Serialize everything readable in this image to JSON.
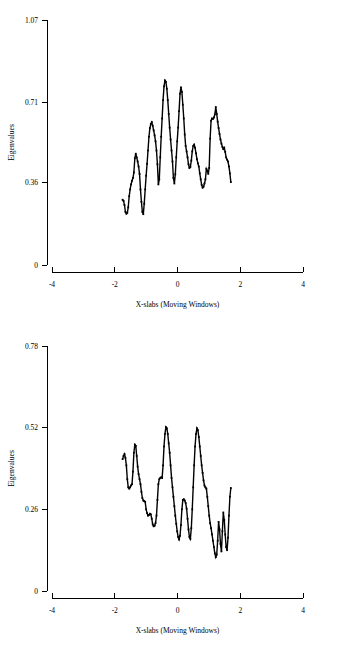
{
  "page": {
    "background_color": "#ffffff",
    "line_color": "#000000",
    "text_color": "#000000"
  },
  "charts": [
    {
      "id": "top",
      "ylabel": "Eigenvalues",
      "xlabel": "X-slabs  (Moving Windows)",
      "ytick_labels": [
        "1.07",
        "0.71",
        "0.36",
        "0"
      ],
      "xtick_labels": [
        "-4",
        "-2",
        "0",
        "2",
        "4"
      ]
    },
    {
      "id": "bottom",
      "ylabel": "Eigenvalues",
      "xlabel": "X-slabs  (Moving Windows)",
      "ytick_labels": [
        "0.78",
        "0.52",
        "0.26",
        "0"
      ],
      "xtick_labels": [
        "-4",
        "-2",
        "0",
        "2",
        "4"
      ]
    }
  ],
  "chart_data": [
    {
      "type": "line",
      "id": "eigenvalue-spectrum-top",
      "title": "",
      "xlabel": "X-slabs  (Moving Windows)",
      "ylabel": "Eigenvalues",
      "xlim": [
        -4,
        4
      ],
      "ylim": [
        0,
        1.07
      ],
      "xticks": [
        -4,
        -2,
        0,
        2,
        4
      ],
      "yticks": [
        0,
        0.36,
        0.71,
        1.07
      ],
      "grid": false,
      "legend": "none",
      "markers": "small-square",
      "x": [
        -1.75,
        -1.72,
        -1.69,
        -1.66,
        -1.63,
        -1.6,
        -1.57,
        -1.54,
        -1.51,
        -1.48,
        -1.45,
        -1.42,
        -1.39,
        -1.36,
        -1.33,
        -1.3,
        -1.27,
        -1.24,
        -1.21,
        -1.18,
        -1.15,
        -1.12,
        -1.09,
        -1.06,
        -1.03,
        -1.0,
        -0.97,
        -0.94,
        -0.91,
        -0.88,
        -0.85,
        -0.82,
        -0.79,
        -0.76,
        -0.73,
        -0.7,
        -0.67,
        -0.64,
        -0.61,
        -0.58,
        -0.55,
        -0.52,
        -0.49,
        -0.46,
        -0.43,
        -0.4,
        -0.37,
        -0.34,
        -0.31,
        -0.28,
        -0.25,
        -0.22,
        -0.19,
        -0.16,
        -0.13,
        -0.1,
        -0.07,
        -0.04,
        -0.01,
        0.02,
        0.05,
        0.08,
        0.11,
        0.14,
        0.17,
        0.2,
        0.23,
        0.26,
        0.29,
        0.32,
        0.35,
        0.38,
        0.41,
        0.44,
        0.47,
        0.5,
        0.53,
        0.56,
        0.59,
        0.62,
        0.65,
        0.68,
        0.71,
        0.74,
        0.77,
        0.8,
        0.83,
        0.86,
        0.89,
        0.92,
        0.95,
        0.98,
        1.01,
        1.04,
        1.07,
        1.1,
        1.13,
        1.16,
        1.19,
        1.22,
        1.25,
        1.28,
        1.31,
        1.34,
        1.37,
        1.4,
        1.43,
        1.46,
        1.49,
        1.52,
        1.55,
        1.58,
        1.61,
        1.64,
        1.67,
        1.7
      ],
      "y": [
        0.285,
        0.28,
        0.262,
        0.232,
        0.224,
        0.228,
        0.252,
        0.3,
        0.33,
        0.352,
        0.368,
        0.38,
        0.404,
        0.466,
        0.486,
        0.47,
        0.452,
        0.43,
        0.398,
        0.33,
        0.276,
        0.232,
        0.222,
        0.268,
        0.33,
        0.39,
        0.442,
        0.5,
        0.56,
        0.598,
        0.616,
        0.624,
        0.608,
        0.588,
        0.566,
        0.54,
        0.5,
        0.44,
        0.352,
        0.374,
        0.47,
        0.56,
        0.64,
        0.72,
        0.78,
        0.806,
        0.8,
        0.77,
        0.72,
        0.66,
        0.6,
        0.548,
        0.5,
        0.452,
        0.38,
        0.356,
        0.396,
        0.47,
        0.54,
        0.6,
        0.672,
        0.748,
        0.776,
        0.756,
        0.7,
        0.64,
        0.57,
        0.52,
        0.496,
        0.47,
        0.44,
        0.424,
        0.428,
        0.456,
        0.496,
        0.52,
        0.526,
        0.512,
        0.488,
        0.462,
        0.444,
        0.43,
        0.4,
        0.374,
        0.35,
        0.338,
        0.342,
        0.356,
        0.374,
        0.42,
        0.412,
        0.398,
        0.424,
        0.552,
        0.63,
        0.64,
        0.638,
        0.644,
        0.658,
        0.69,
        0.66,
        0.626,
        0.598,
        0.572,
        0.548,
        0.53,
        0.516,
        0.506,
        0.512,
        0.494,
        0.47,
        0.46,
        0.452,
        0.43,
        0.4,
        0.362
      ]
    },
    {
      "type": "line",
      "id": "eigenvalue-spectrum-bottom",
      "title": "",
      "xlabel": "X-slabs  (Moving Windows)",
      "ylabel": "Eigenvalues",
      "xlim": [
        -4,
        4
      ],
      "ylim": [
        0,
        0.78
      ],
      "xticks": [
        -4,
        -2,
        0,
        2,
        4
      ],
      "yticks": [
        0,
        0.26,
        0.52,
        0.78
      ],
      "grid": false,
      "legend": "none",
      "markers": "small-square",
      "x": [
        -1.75,
        -1.72,
        -1.69,
        -1.66,
        -1.63,
        -1.6,
        -1.57,
        -1.54,
        -1.51,
        -1.48,
        -1.45,
        -1.42,
        -1.39,
        -1.36,
        -1.33,
        -1.3,
        -1.27,
        -1.24,
        -1.21,
        -1.18,
        -1.15,
        -1.12,
        -1.09,
        -1.06,
        -1.03,
        -1.0,
        -0.97,
        -0.94,
        -0.91,
        -0.88,
        -0.85,
        -0.82,
        -0.79,
        -0.76,
        -0.73,
        -0.7,
        -0.67,
        -0.64,
        -0.61,
        -0.58,
        -0.55,
        -0.52,
        -0.49,
        -0.46,
        -0.43,
        -0.4,
        -0.37,
        -0.34,
        -0.31,
        -0.28,
        -0.25,
        -0.22,
        -0.19,
        -0.16,
        -0.13,
        -0.1,
        -0.07,
        -0.04,
        -0.01,
        0.02,
        0.05,
        0.08,
        0.11,
        0.14,
        0.17,
        0.2,
        0.23,
        0.26,
        0.29,
        0.32,
        0.35,
        0.38,
        0.41,
        0.44,
        0.47,
        0.5,
        0.53,
        0.56,
        0.59,
        0.62,
        0.65,
        0.68,
        0.71,
        0.74,
        0.77,
        0.8,
        0.83,
        0.86,
        0.89,
        0.92,
        0.95,
        0.98,
        1.01,
        1.04,
        1.07,
        1.1,
        1.13,
        1.16,
        1.19,
        1.22,
        1.25,
        1.28,
        1.31,
        1.34,
        1.37,
        1.4,
        1.43,
        1.46,
        1.49,
        1.52,
        1.55,
        1.58,
        1.61,
        1.64,
        1.67,
        1.7
      ],
      "y": [
        0.42,
        0.43,
        0.436,
        0.424,
        0.4,
        0.356,
        0.33,
        0.326,
        0.33,
        0.336,
        0.34,
        0.38,
        0.44,
        0.466,
        0.462,
        0.43,
        0.396,
        0.372,
        0.356,
        0.34,
        0.316,
        0.296,
        0.288,
        0.286,
        0.284,
        0.26,
        0.248,
        0.24,
        0.242,
        0.246,
        0.244,
        0.23,
        0.212,
        0.206,
        0.208,
        0.216,
        0.24,
        0.29,
        0.34,
        0.356,
        0.36,
        0.362,
        0.36,
        0.4,
        0.46,
        0.5,
        0.522,
        0.518,
        0.5,
        0.47,
        0.44,
        0.4,
        0.36,
        0.33,
        0.3,
        0.27,
        0.24,
        0.214,
        0.19,
        0.172,
        0.164,
        0.176,
        0.21,
        0.26,
        0.29,
        0.292,
        0.288,
        0.28,
        0.262,
        0.23,
        0.196,
        0.172,
        0.166,
        0.2,
        0.26,
        0.33,
        0.4,
        0.46,
        0.5,
        0.518,
        0.512,
        0.49,
        0.46,
        0.43,
        0.4,
        0.376,
        0.352,
        0.336,
        0.33,
        0.326,
        0.3,
        0.27,
        0.24,
        0.216,
        0.2,
        0.18,
        0.16,
        0.14,
        0.12,
        0.108,
        0.116,
        0.16,
        0.22,
        0.196,
        0.15,
        0.126,
        0.19,
        0.25,
        0.226,
        0.18,
        0.14,
        0.13,
        0.17,
        0.24,
        0.3,
        0.328
      ]
    }
  ]
}
